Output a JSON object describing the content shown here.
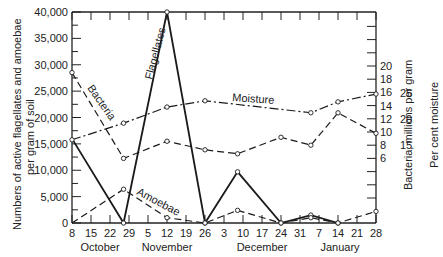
{
  "chart_data": {
    "type": "line",
    "title": "",
    "xlabel": "",
    "x_tick_labels": [
      "8",
      "15",
      "22",
      "29",
      "5",
      "12",
      "19",
      "26",
      "3",
      "10",
      "17",
      "24",
      "31",
      "7",
      "14",
      "21",
      "28"
    ],
    "x_month_labels": [
      "October",
      "November",
      "December",
      "January"
    ],
    "ylabel_left": "Numbers of active flagellates and amoebae per gram of soil",
    "ylabel_right_1": "Bacteria, millions per gram",
    "ylabel_right_2": "Per cent moisture",
    "ylim_left": [
      0,
      40000
    ],
    "y_left_ticks": [
      "0",
      "5,000",
      "10,000",
      "15,000",
      "20,000",
      "25,000",
      "30,000",
      "35,000",
      "40,000"
    ],
    "y_right_bacteria_ticks": [
      "6",
      "8",
      "10",
      "12",
      "14",
      "16",
      "18",
      "20"
    ],
    "y_right_moisture_ticks": [
      "15",
      "20",
      "25"
    ],
    "grid": false,
    "legend": "inline annotations",
    "series": [
      {
        "name": "Flagellates",
        "axis": "left",
        "style": "solid",
        "x": [
          "Oct 8",
          "Oct 27",
          "Nov 12",
          "Nov 26",
          "Dec 8",
          "Dec 24",
          "Jan 4",
          "Jan 14"
        ],
        "values": [
          16000,
          0,
          40000,
          0,
          9700,
          0,
          1500,
          0
        ]
      },
      {
        "name": "Amoebae",
        "axis": "left",
        "style": "dashed",
        "x": [
          "Oct 8",
          "Oct 27",
          "Nov 12",
          "Nov 26",
          "Dec 8",
          "Dec 24",
          "Jan 4",
          "Jan 14",
          "Jan 28"
        ],
        "values": [
          0,
          6400,
          1000,
          0,
          2400,
          0,
          1000,
          0,
          2200
        ]
      },
      {
        "name": "Bacteria",
        "axis": "right_bacteria",
        "unit": "millions per gram",
        "style": "dashed",
        "x": [
          "Oct 8",
          "Oct 27",
          "Nov 12",
          "Nov 26",
          "Dec 8",
          "Dec 24",
          "Jan 4",
          "Jan 14",
          "Jan 28"
        ],
        "values": [
          19,
          6,
          8.6,
          7.3,
          6.7,
          9.2,
          8,
          12.9,
          9.8
        ]
      },
      {
        "name": "Moisture",
        "axis": "right_moisture",
        "unit": "per cent",
        "style": "dash-dot",
        "x": [
          "Oct 8",
          "Oct 27",
          "Nov 12",
          "Nov 26",
          "Jan 4",
          "Jan 14",
          "Jan 28"
        ],
        "values": [
          16,
          19.2,
          22.3,
          23.5,
          21.2,
          23.3,
          24.8
        ]
      }
    ],
    "annotations": [
      "Flagellates",
      "Amoebae",
      "Bacteria",
      "Moisture"
    ]
  }
}
